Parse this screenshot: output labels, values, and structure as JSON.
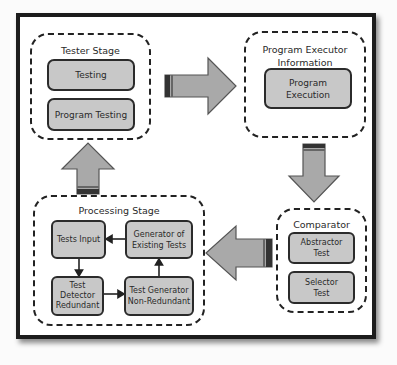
{
  "colors": {
    "frame_border": "#1c1c1c",
    "box_fill": "#c8c8c8",
    "arrow_fill": "#a9a9a9",
    "arrow_stroke": "#555555",
    "arrow_tail_dark": "#333333"
  },
  "stages": {
    "tester": {
      "title": "Tester Stage",
      "items": [
        "Testing",
        "Program Testing"
      ]
    },
    "executor": {
      "title_line1": "Program Executor",
      "title_line2": "Information",
      "items": [
        {
          "line1": "Program",
          "line2": "Execution"
        }
      ]
    },
    "comparator": {
      "title": "Comparator",
      "items": [
        {
          "line1": "Abstractor",
          "line2": "Test"
        },
        {
          "line1": "Selector",
          "line2": "Test"
        }
      ]
    },
    "processing": {
      "title": "Processing Stage",
      "nodes": {
        "tests_input": {
          "line1": "Tests Input"
        },
        "generator_existing": {
          "line1": "Generator of",
          "line2": "Existing Tests"
        },
        "detector_redundant": {
          "line1": "Test",
          "line2": "Detector",
          "line3": "Redundant"
        },
        "generator_non_redundant": {
          "line1": "Test Generator",
          "line2": "Non-Redundant"
        }
      }
    }
  },
  "flow": [
    "Tester Stage -> Program Executor Information",
    "Program Executor Information -> Comparator",
    "Comparator -> Processing Stage",
    "Processing Stage -> Tester Stage"
  ],
  "processing_flow": [
    "Generator of Existing Tests -> Tests Input",
    "Tests Input -> Test Detector Redundant",
    "Test Detector Redundant -> Test Generator Non-Redundant",
    "Test Generator Non-Redundant -> Generator of Existing Tests"
  ]
}
